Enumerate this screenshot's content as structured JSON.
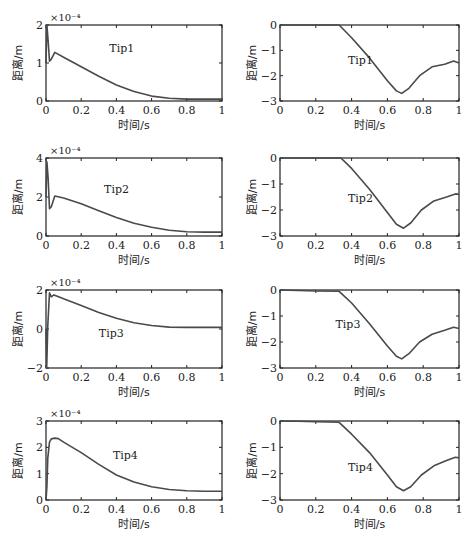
{
  "chart_data": [
    {
      "type": "line",
      "id": "tip1-left",
      "annotation": "Tip1",
      "xlabel": "时间/s",
      "ylabel": "距离/m",
      "exponent": "×10⁻⁴",
      "xlim": [
        0,
        1
      ],
      "ylim": [
        0,
        2
      ],
      "xticks": [
        "0",
        "0.2",
        "0.4",
        "0.6",
        "0.8",
        "1"
      ],
      "yticks": [
        "0",
        "1",
        "2"
      ],
      "x": [
        0,
        0.005,
        0.012,
        0.02,
        0.03,
        0.05,
        0.1,
        0.2,
        0.3,
        0.4,
        0.5,
        0.6,
        0.7,
        0.8,
        0.9,
        1.0
      ],
      "y": [
        1.0,
        2.0,
        1.6,
        1.05,
        1.1,
        1.28,
        1.15,
        0.9,
        0.65,
        0.42,
        0.25,
        0.13,
        0.07,
        0.05,
        0.05,
        0.05
      ]
    },
    {
      "type": "line",
      "id": "tip1-right",
      "annotation": "Tip1",
      "xlabel": "时间/s",
      "ylabel": "距离/m",
      "xlim": [
        0,
        1
      ],
      "ylim": [
        -3,
        0
      ],
      "xticks": [
        "0",
        "0.2",
        "0.4",
        "0.6",
        "0.8",
        "1"
      ],
      "yticks": [
        "0",
        "−1",
        "−2",
        "−3"
      ],
      "x": [
        0,
        0.33,
        0.4,
        0.5,
        0.6,
        0.65,
        0.68,
        0.72,
        0.78,
        0.85,
        0.92,
        0.97,
        1.0
      ],
      "y": [
        0,
        0,
        -0.5,
        -1.3,
        -2.2,
        -2.6,
        -2.7,
        -2.5,
        -2.0,
        -1.65,
        -1.55,
        -1.42,
        -1.5
      ]
    },
    {
      "type": "line",
      "id": "tip2-left",
      "annotation": "Tip2",
      "xlabel": "时间/s",
      "ylabel": "距离/m",
      "exponent": "×10⁻⁴",
      "xlim": [
        0,
        1
      ],
      "ylim": [
        0,
        4
      ],
      "xticks": [
        "0",
        "0.2",
        "0.4",
        "0.6",
        "0.8",
        "1"
      ],
      "yticks": [
        "0",
        "2",
        "4"
      ],
      "x": [
        0,
        0.005,
        0.012,
        0.02,
        0.03,
        0.05,
        0.1,
        0.2,
        0.3,
        0.4,
        0.5,
        0.6,
        0.7,
        0.8,
        0.9,
        1.0
      ],
      "y": [
        2.0,
        3.8,
        3.0,
        1.4,
        1.5,
        2.05,
        1.95,
        1.65,
        1.3,
        0.95,
        0.65,
        0.45,
        0.3,
        0.22,
        0.2,
        0.2
      ]
    },
    {
      "type": "line",
      "id": "tip2-right",
      "annotation": "Tip2",
      "xlabel": "时间/s",
      "ylabel": "距离/m",
      "xlim": [
        0,
        1
      ],
      "ylim": [
        -3,
        0
      ],
      "xticks": [
        "0",
        "0.2",
        "0.4",
        "0.6",
        "0.8",
        "1"
      ],
      "yticks": [
        "0",
        "−1",
        "−2",
        "−3"
      ],
      "x": [
        0,
        0.34,
        0.4,
        0.5,
        0.6,
        0.65,
        0.69,
        0.73,
        0.79,
        0.86,
        0.93,
        0.98,
        1.0
      ],
      "y": [
        0,
        0,
        -0.4,
        -1.2,
        -2.1,
        -2.55,
        -2.7,
        -2.5,
        -2.0,
        -1.65,
        -1.5,
        -1.38,
        -1.4
      ]
    },
    {
      "type": "line",
      "id": "tip3-left",
      "annotation": "Tip3",
      "xlabel": "时间/s",
      "ylabel": "距离/m",
      "exponent": "×10⁻⁴",
      "xlim": [
        0,
        1
      ],
      "ylim": [
        -2,
        2
      ],
      "xticks": [
        "0",
        "0.2",
        "0.4",
        "0.6",
        "0.8",
        "1"
      ],
      "yticks": [
        "−2",
        "0",
        "2"
      ],
      "x": [
        0,
        0.004,
        0.01,
        0.02,
        0.03,
        0.045,
        0.06,
        0.1,
        0.2,
        0.3,
        0.4,
        0.5,
        0.6,
        0.7,
        0.8,
        0.9,
        1.0
      ],
      "y": [
        0,
        -2.0,
        0.2,
        1.85,
        1.65,
        1.75,
        1.7,
        1.55,
        1.2,
        0.85,
        0.55,
        0.32,
        0.18,
        0.1,
        0.08,
        0.08,
        0.08
      ]
    },
    {
      "type": "line",
      "id": "tip3-right",
      "annotation": "Tip3",
      "xlabel": "时间/s",
      "ylabel": "距离/m",
      "xlim": [
        0,
        1
      ],
      "ylim": [
        -3,
        0
      ],
      "xticks": [
        "0",
        "0.2",
        "0.4",
        "0.6",
        "0.8",
        "1"
      ],
      "yticks": [
        "0",
        "−1",
        "−2",
        "−3"
      ],
      "x": [
        0,
        0.1,
        0.2,
        0.33,
        0.4,
        0.5,
        0.6,
        0.65,
        0.68,
        0.72,
        0.78,
        0.85,
        0.92,
        0.97,
        1.0
      ],
      "y": [
        0,
        -0.02,
        -0.04,
        -0.05,
        -0.5,
        -1.3,
        -2.15,
        -2.55,
        -2.65,
        -2.45,
        -2.0,
        -1.7,
        -1.55,
        -1.43,
        -1.48
      ]
    },
    {
      "type": "line",
      "id": "tip4-left",
      "annotation": "Tip4",
      "xlabel": "时间/s",
      "ylabel": "距离/m",
      "exponent": "×10⁻⁴",
      "xlim": [
        0,
        1
      ],
      "ylim": [
        0,
        3
      ],
      "xticks": [
        "0",
        "0.2",
        "0.4",
        "0.6",
        "0.8",
        "1"
      ],
      "yticks": [
        "0",
        "1",
        "2",
        "3"
      ],
      "x": [
        0,
        0.005,
        0.01,
        0.02,
        0.03,
        0.05,
        0.07,
        0.1,
        0.2,
        0.3,
        0.4,
        0.5,
        0.6,
        0.7,
        0.8,
        0.9,
        1.0
      ],
      "y": [
        0,
        0.5,
        1.6,
        2.2,
        2.32,
        2.35,
        2.33,
        2.2,
        1.8,
        1.35,
        0.95,
        0.68,
        0.5,
        0.4,
        0.35,
        0.33,
        0.33
      ]
    },
    {
      "type": "line",
      "id": "tip4-right",
      "annotation": "Tip4",
      "xlabel": "时间/s",
      "ylabel": "距离/m",
      "xlim": [
        0,
        1
      ],
      "ylim": [
        -3,
        0
      ],
      "xticks": [
        "0",
        "0.2",
        "0.4",
        "0.6",
        "0.8",
        "1"
      ],
      "yticks": [
        "0",
        "−1",
        "−2",
        "−3"
      ],
      "x": [
        0,
        0.1,
        0.2,
        0.33,
        0.4,
        0.5,
        0.6,
        0.65,
        0.69,
        0.73,
        0.79,
        0.86,
        0.93,
        0.98,
        1.0
      ],
      "y": [
        0,
        -0.01,
        -0.03,
        -0.05,
        -0.5,
        -1.2,
        -2.05,
        -2.5,
        -2.65,
        -2.5,
        -2.05,
        -1.7,
        -1.5,
        -1.38,
        -1.4
      ]
    }
  ],
  "layout": {
    "line_color": "#4a4a4a",
    "axis_color": "#222222",
    "panels": [
      {
        "x0": 46,
        "x1": 222,
        "y0": 25,
        "y1": 101,
        "ann_x": 0.36,
        "ann_y": 1.3
      },
      {
        "x0": 280,
        "x1": 459,
        "y0": 25,
        "y1": 101,
        "ann_x": 0.38,
        "ann_y": -1.55
      },
      {
        "x0": 46,
        "x1": 222,
        "y0": 158,
        "y1": 236,
        "ann_x": 0.33,
        "ann_y": 2.2
      },
      {
        "x0": 280,
        "x1": 459,
        "y0": 158,
        "y1": 236,
        "ann_x": 0.38,
        "ann_y": -1.7
      },
      {
        "x0": 46,
        "x1": 222,
        "y0": 290,
        "y1": 368,
        "ann_x": 0.3,
        "ann_y": -0.4
      },
      {
        "x0": 280,
        "x1": 459,
        "y0": 290,
        "y1": 368,
        "ann_x": 0.31,
        "ann_y": -1.45
      },
      {
        "x0": 46,
        "x1": 222,
        "y0": 421,
        "y1": 500,
        "ann_x": 0.38,
        "ann_y": 1.55
      },
      {
        "x0": 280,
        "x1": 459,
        "y0": 421,
        "y1": 500,
        "ann_x": 0.38,
        "ann_y": -1.9
      }
    ]
  }
}
